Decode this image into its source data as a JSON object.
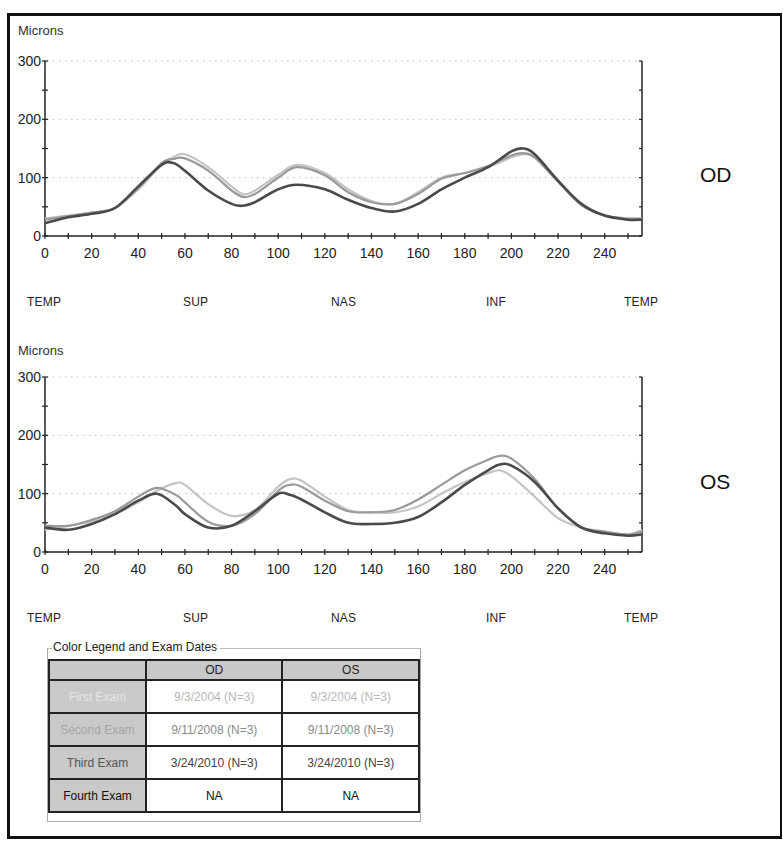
{
  "colors": {
    "first_exam": "#c4c4c4",
    "second_exam": "#9a9a9a",
    "third_exam": "#4a4a4a",
    "grid": "#bdbdbd",
    "axis": "#222222",
    "legend_header_bg": "#c8c8c8"
  },
  "charts": {
    "od": {
      "ylabel": "Microns",
      "eye": "OD",
      "y_ticks": [
        "0",
        "100",
        "200",
        "300"
      ],
      "x_ticks": [
        "0",
        "20",
        "40",
        "60",
        "80",
        "100",
        "120",
        "140",
        "160",
        "180",
        "200",
        "220",
        "240"
      ],
      "regions": [
        "TEMP",
        "SUP",
        "NAS",
        "INF",
        "TEMP"
      ]
    },
    "os": {
      "ylabel": "Microns",
      "eye": "OS",
      "y_ticks": [
        "0",
        "100",
        "200",
        "300"
      ],
      "x_ticks": [
        "0",
        "20",
        "40",
        "60",
        "80",
        "100",
        "120",
        "140",
        "160",
        "180",
        "200",
        "220",
        "240"
      ],
      "regions": [
        "TEMP",
        "SUP",
        "NAS",
        "INF",
        "TEMP"
      ]
    }
  },
  "legend": {
    "title": "Color Legend and Exam Dates",
    "columns": [
      "",
      "OD",
      "OS"
    ],
    "rows": [
      {
        "label": "First Exam",
        "od": "9/3/2004  (N=3)",
        "os": "9/3/2004  (N=3)",
        "color": "#d0d0d0"
      },
      {
        "label": "Second Exam",
        "od": "9/11/2008  (N=3)",
        "os": "9/11/2008  (N=3)",
        "color": "#a8a8a8"
      },
      {
        "label": "Third Exam",
        "od": "3/24/2010  (N=3)",
        "os": "3/24/2010  (N=3)",
        "color": "#444444"
      },
      {
        "label": "Fourth Exam",
        "od": "NA",
        "os": "NA",
        "color": "#111111"
      }
    ]
  },
  "chart_data": [
    {
      "type": "line",
      "title": "OD",
      "xlabel": "",
      "ylabel": "Microns",
      "xlim": [
        0,
        256
      ],
      "ylim": [
        0,
        300
      ],
      "grid": "horizontal dotted at 100, 200, 300",
      "legend_position": "table below charts",
      "x_tick_labels": [
        0,
        20,
        40,
        60,
        80,
        100,
        120,
        140,
        160,
        180,
        200,
        220,
        240
      ],
      "region_labels": [
        "TEMP",
        "SUP",
        "NAS",
        "INF",
        "TEMP"
      ],
      "x": [
        0,
        10,
        20,
        30,
        40,
        50,
        55,
        60,
        70,
        80,
        85,
        90,
        100,
        108,
        120,
        130,
        140,
        150,
        160,
        170,
        180,
        190,
        200,
        205,
        210,
        220,
        230,
        240,
        250,
        256
      ],
      "series": [
        {
          "name": "First Exam (9/3/2004)",
          "values": [
            30,
            35,
            40,
            48,
            80,
            122,
            135,
            140,
            118,
            85,
            72,
            78,
            105,
            122,
            108,
            80,
            60,
            55,
            75,
            100,
            108,
            118,
            135,
            140,
            135,
            95,
            55,
            35,
            30,
            30
          ]
        },
        {
          "name": "Second Exam (9/11/2008)",
          "values": [
            28,
            34,
            40,
            48,
            82,
            125,
            132,
            133,
            112,
            78,
            67,
            72,
            100,
            118,
            104,
            75,
            58,
            55,
            72,
            98,
            108,
            120,
            138,
            142,
            135,
            93,
            53,
            35,
            30,
            30
          ]
        },
        {
          "name": "Third Exam (3/24/2010)",
          "values": [
            22,
            32,
            38,
            48,
            85,
            122,
            125,
            112,
            78,
            55,
            52,
            58,
            80,
            88,
            80,
            62,
            48,
            42,
            55,
            80,
            100,
            118,
            145,
            150,
            140,
            95,
            55,
            35,
            28,
            28
          ]
        }
      ]
    },
    {
      "type": "line",
      "title": "OS",
      "xlabel": "",
      "ylabel": "Microns",
      "xlim": [
        0,
        256
      ],
      "ylim": [
        0,
        300
      ],
      "grid": "horizontal dotted at 100, 200, 300",
      "legend_position": "table below charts",
      "x_tick_labels": [
        0,
        20,
        40,
        60,
        80,
        100,
        120,
        140,
        160,
        180,
        200,
        220,
        240
      ],
      "region_labels": [
        "TEMP",
        "SUP",
        "NAS",
        "INF",
        "TEMP"
      ],
      "x": [
        0,
        10,
        20,
        30,
        40,
        48,
        56,
        60,
        70,
        80,
        90,
        100,
        105,
        110,
        120,
        130,
        140,
        150,
        160,
        170,
        180,
        190,
        195,
        200,
        210,
        220,
        230,
        240,
        250,
        256
      ],
      "series": [
        {
          "name": "First Exam (9/3/2004)",
          "values": [
            38,
            45,
            52,
            65,
            85,
            105,
            118,
            115,
            82,
            62,
            72,
            112,
            125,
            122,
            95,
            72,
            68,
            68,
            78,
            100,
            120,
            135,
            140,
            130,
            95,
            58,
            42,
            35,
            30,
            38
          ]
        },
        {
          "name": "Second Exam (9/11/2008)",
          "values": [
            45,
            45,
            55,
            70,
            95,
            110,
            98,
            85,
            52,
            45,
            65,
            105,
            115,
            112,
            88,
            70,
            68,
            72,
            90,
            115,
            140,
            158,
            165,
            160,
            125,
            75,
            42,
            35,
            30,
            35
          ]
        },
        {
          "name": "Third Exam (3/24/2010)",
          "values": [
            42,
            38,
            48,
            65,
            88,
            100,
            80,
            65,
            42,
            45,
            70,
            100,
            98,
            90,
            68,
            50,
            48,
            50,
            60,
            85,
            115,
            140,
            150,
            148,
            120,
            75,
            42,
            32,
            28,
            30
          ]
        }
      ]
    }
  ]
}
